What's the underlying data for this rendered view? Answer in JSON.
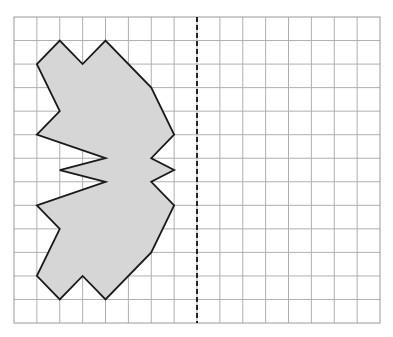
{
  "diagram": {
    "type": "reflection-grid",
    "grid": {
      "columns": 16,
      "rows": 13,
      "origin_px": [
        14,
        17
      ],
      "cell_w": 22.875,
      "cell_h": 23.54,
      "line_color": "#b0b0b0",
      "border_color": "#9a9a9a"
    },
    "mirror_line": {
      "orientation": "vertical",
      "column": 8,
      "style": "dashed",
      "color": "#111111"
    },
    "shape": {
      "fill": "#d6d6d6",
      "stroke": "#1a1a1a",
      "vertices": [
        [
          1,
          2
        ],
        [
          2,
          1
        ],
        [
          3,
          2
        ],
        [
          4,
          1
        ],
        [
          6,
          3
        ],
        [
          7,
          5
        ],
        [
          6,
          6
        ],
        [
          7,
          6.5
        ],
        [
          6,
          7
        ],
        [
          7,
          8
        ],
        [
          6,
          10
        ],
        [
          4,
          12
        ],
        [
          3,
          11
        ],
        [
          2,
          12
        ],
        [
          1,
          11
        ],
        [
          2,
          9
        ],
        [
          1,
          8
        ],
        [
          4,
          7
        ],
        [
          2,
          6.5
        ],
        [
          4,
          6
        ],
        [
          1,
          5
        ],
        [
          2,
          4
        ]
      ]
    }
  }
}
